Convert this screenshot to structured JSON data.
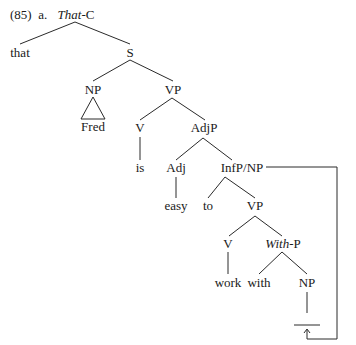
{
  "example": {
    "number": "(85)",
    "sub": "a.",
    "root_italic": "That",
    "root_suffix": "-C"
  },
  "nodes": {
    "that": "that",
    "S": "S",
    "NP_subj": "NP",
    "fred": "Fred",
    "VP_main": "VP",
    "V_main": "V",
    "is": "is",
    "AdjP": "AdjP",
    "Adj": "Adj",
    "easy": "easy",
    "InfP": "InfP/NP",
    "to": "to",
    "VP_inf": "VP",
    "V_inf": "V",
    "work": "work",
    "withP_italic": "With",
    "withP_suffix": "-P",
    "with": "with",
    "NP_obj": "NP"
  }
}
